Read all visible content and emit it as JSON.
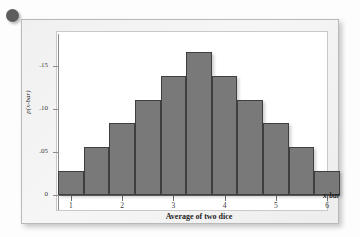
{
  "figure": {
    "bullet_icon": "bullet-dot",
    "has_title": false
  },
  "chart_data": {
    "type": "bar",
    "title": "",
    "subtitle": "",
    "xlabel": "Average of two dice",
    "ylabel": "p(x-bar)",
    "axis_end_label": "x-bar",
    "categories": [
      "1",
      "1.5",
      "2",
      "2.5",
      "3",
      "3.5",
      "4",
      "4.5",
      "5",
      "5.5",
      "6"
    ],
    "values": [
      0.0278,
      0.0556,
      0.0833,
      0.1111,
      0.1389,
      0.1667,
      0.1389,
      0.1111,
      0.0833,
      0.0556,
      0.0278
    ],
    "x_tick_labels": [
      "1",
      "2",
      "3",
      "4",
      "5",
      "6"
    ],
    "x_tick_values": [
      1,
      2,
      3,
      4,
      5,
      6
    ],
    "y_tick_labels": [
      "0",
      ".05",
      ".10",
      ".15"
    ],
    "y_tick_values": [
      0,
      0.05,
      0.1,
      0.15
    ],
    "xlim": [
      0.75,
      6.25
    ],
    "ylim": [
      0,
      0.1875
    ],
    "grid": false,
    "legend": false,
    "bar_color": "#797979",
    "bar_edge_color": "#3f3f3f",
    "plot_background": "#ffffff",
    "frame_background": "#f2f2f2"
  }
}
